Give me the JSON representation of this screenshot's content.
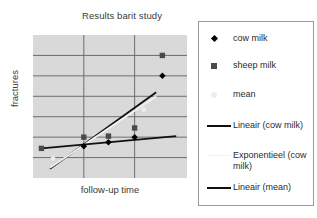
{
  "chart_data": {
    "type": "scatter",
    "title": "Results barit study",
    "xlabel": "follow-up time",
    "ylabel": "fractures",
    "xlim": [
      0,
      10
    ],
    "ylim": [
      0,
      7
    ],
    "grid": true,
    "grid_x_ticks": [
      3.3,
      6.6
    ],
    "grid_y_ticks": [
      1,
      2,
      3,
      4,
      5,
      6
    ],
    "legend_position": "right",
    "series": [
      {
        "name": "cow milk",
        "marker": "diamond",
        "color": "#000000",
        "points": [
          {
            "x": 3.3,
            "y": 1.55
          },
          {
            "x": 4.9,
            "y": 1.75
          },
          {
            "x": 6.6,
            "y": 2.0
          },
          {
            "x": 8.4,
            "y": 5.0
          }
        ]
      },
      {
        "name": "sheep milk",
        "marker": "square",
        "color": "#4a4a4a",
        "points": [
          {
            "x": 0.55,
            "y": 1.45
          },
          {
            "x": 3.3,
            "y": 2.0
          },
          {
            "x": 4.9,
            "y": 2.05
          },
          {
            "x": 6.6,
            "y": 2.45
          },
          {
            "x": 8.4,
            "y": 6.0
          }
        ]
      },
      {
        "name": "mean",
        "marker": "faint-dot",
        "color": "#ededed",
        "points": [
          {
            "x": 1.3,
            "y": 0.95
          },
          {
            "x": 7.2,
            "y": 3.35
          }
        ]
      }
    ],
    "trendlines": [
      {
        "name": "Lineair (cow milk)",
        "color": "#111111",
        "x1": 1.1,
        "y1": 0.45,
        "x2": 8.0,
        "y2": 4.2
      },
      {
        "name": "Exponentieel (cow milk)",
        "color": "#f2f2f2",
        "x1": 1.1,
        "y1": 0.5,
        "x2": 8.0,
        "y2": 4.0
      },
      {
        "name": "Lineair (mean)",
        "color": "#111111",
        "x1": 0.55,
        "y1": 1.45,
        "x2": 9.3,
        "y2": 2.05
      }
    ]
  },
  "legend": {
    "entries": [
      {
        "label": "cow milk",
        "key": "diamond-marker"
      },
      {
        "label": "sheep milk",
        "key": "square-marker"
      },
      {
        "label": "mean",
        "key": "faint-marker"
      },
      {
        "label": "Lineair (cow milk)",
        "key": "solid-line"
      },
      {
        "label": "Exponentieel (cow milk)",
        "key": "faint-line"
      },
      {
        "label": "Lineair (mean)",
        "key": "solid-line"
      }
    ]
  },
  "colors": {
    "plot_background": "#d9d9d9",
    "gridline": "#6e6e6e",
    "legend_border": "#9a9aa2",
    "text": "#2b2b2b"
  }
}
